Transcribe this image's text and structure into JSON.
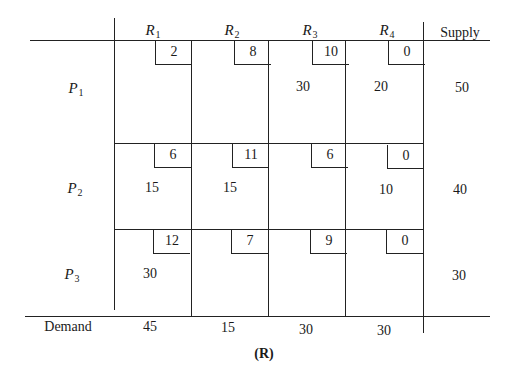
{
  "table": {
    "columns": [
      {
        "label": "R",
        "sub": "1"
      },
      {
        "label": "R",
        "sub": "2"
      },
      {
        "label": "R",
        "sub": "3"
      },
      {
        "label": "R",
        "sub": "4"
      }
    ],
    "supply_header": "Supply",
    "rows": [
      {
        "label": "P",
        "sub": "1",
        "costs": [
          "2",
          "8",
          "10",
          "0"
        ],
        "allocations": [
          "",
          "",
          "30",
          "20"
        ],
        "supply": "50"
      },
      {
        "label": "P",
        "sub": "2",
        "costs": [
          "6",
          "11",
          "6",
          "0"
        ],
        "allocations": [
          "15",
          "15",
          "",
          "10"
        ],
        "supply": "40"
      },
      {
        "label": "P",
        "sub": "3",
        "costs": [
          "12",
          "7",
          "9",
          "0"
        ],
        "allocations": [
          "30",
          "",
          "",
          ""
        ],
        "supply": "30"
      }
    ],
    "demand_label": "Demand",
    "demand": [
      "45",
      "15",
      "30",
      "30"
    ]
  },
  "caption": "(R)"
}
